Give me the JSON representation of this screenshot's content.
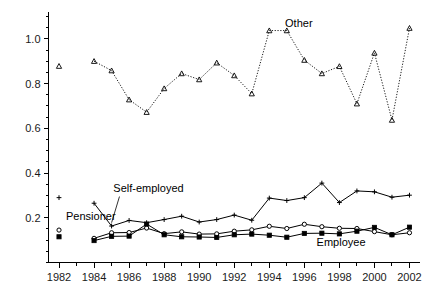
{
  "chart_data": {
    "type": "line",
    "title": "",
    "xlabel": "",
    "ylabel": "",
    "xlim": [
      1981.4,
      2002.6
    ],
    "ylim": [
      0.0,
      1.12
    ],
    "grid": false,
    "legend_position": "inline-annotations",
    "x_tick_labels": [
      "1982",
      "1984",
      "1986",
      "1988",
      "1990",
      "1992",
      "1994",
      "1996",
      "1998",
      "2000",
      "2002"
    ],
    "x_tick_values": [
      1982,
      1984,
      1986,
      1988,
      1990,
      1992,
      1994,
      1996,
      1998,
      2000,
      2002
    ],
    "x_minor_step": 1,
    "y_tick_labels": [
      "0.2",
      "0.4",
      "0.6",
      "0.8",
      "1.0"
    ],
    "y_tick_values": [
      0.2,
      0.4,
      0.6,
      0.8,
      1.0
    ],
    "y_minor_step": 0.05,
    "annotations": [
      {
        "text": "Other",
        "x": 1994.9,
        "y": 1.055
      },
      {
        "text": "Self-employed",
        "x": 1985.1,
        "y": 0.315
      },
      {
        "text": "Pensioner",
        "x": 1982.4,
        "y": 0.192
      },
      {
        "text": "Employee",
        "x": 1996.7,
        "y": 0.075
      }
    ],
    "series": [
      {
        "name": "Other",
        "marker": "triangle",
        "line_style": "dotted",
        "color": "#000000",
        "isolated_point": {
          "x": 1982,
          "y": 0.878
        },
        "x": [
          1984,
          1985,
          1986,
          1987,
          1988,
          1989,
          1990,
          1991,
          1992,
          1993,
          1994,
          1995,
          1996,
          1997,
          1998,
          1999,
          2000,
          2001,
          2002
        ],
        "values": [
          0.9,
          0.858,
          0.728,
          0.672,
          0.778,
          0.845,
          0.818,
          0.893,
          0.836,
          0.755,
          1.037,
          1.037,
          0.905,
          0.845,
          0.877,
          0.71,
          0.937,
          0.637,
          1.048
        ]
      },
      {
        "name": "Self-employed",
        "marker": "plus",
        "line_style": "solid",
        "color": "#000000",
        "isolated_point": {
          "x": 1982,
          "y": 0.29
        },
        "x": [
          1984,
          1985,
          1986,
          1987,
          1988,
          1989,
          1990,
          1991,
          1992,
          1993,
          1994,
          1995,
          1996,
          1997,
          1998,
          1999,
          2000,
          2001,
          2002
        ],
        "values": [
          0.265,
          0.163,
          0.188,
          0.178,
          0.192,
          0.207,
          0.181,
          0.192,
          0.212,
          0.189,
          0.288,
          0.277,
          0.29,
          0.355,
          0.268,
          0.32,
          0.316,
          0.292,
          0.301
        ]
      },
      {
        "name": "Pensioner",
        "marker": "circle",
        "line_style": "solid",
        "color": "#000000",
        "isolated_point": {
          "x": 1982,
          "y": 0.145
        },
        "x": [
          1984,
          1985,
          1986,
          1987,
          1988,
          1989,
          1990,
          1991,
          1992,
          1993,
          1994,
          1995,
          1996,
          1997,
          1998,
          1999,
          2000,
          2001,
          2002
        ],
        "values": [
          0.108,
          0.133,
          0.134,
          0.154,
          0.129,
          0.137,
          0.127,
          0.128,
          0.14,
          0.146,
          0.162,
          0.152,
          0.171,
          0.16,
          0.153,
          0.152,
          0.138,
          0.124,
          0.133
        ]
      },
      {
        "name": "Employee",
        "marker": "filled-square",
        "line_style": "solid",
        "color": "#000000",
        "isolated_point": {
          "x": 1982,
          "y": 0.115
        },
        "x": [
          1984,
          1985,
          1986,
          1987,
          1988,
          1989,
          1990,
          1991,
          1992,
          1993,
          1994,
          1995,
          1996,
          1997,
          1998,
          1999,
          2000,
          2001,
          2002
        ],
        "values": [
          0.098,
          0.117,
          0.118,
          0.172,
          0.124,
          0.115,
          0.114,
          0.112,
          0.124,
          0.127,
          0.122,
          0.113,
          0.13,
          0.131,
          0.128,
          0.14,
          0.157,
          0.124,
          0.158
        ]
      }
    ]
  }
}
